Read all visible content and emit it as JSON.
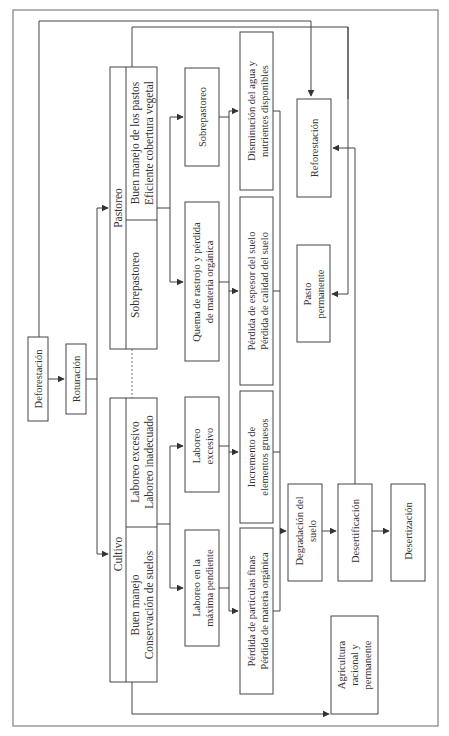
{
  "diagram": {
    "orientation": "rotated-90-ccw",
    "colors": {
      "line": "#444444",
      "frame": "#8a8a8a",
      "text": "#333333",
      "background": "#ffffff"
    },
    "nodes": {
      "deforestacion": {
        "label": "Deforestación"
      },
      "roturacion": {
        "label": "Roturación"
      },
      "pastoreo": {
        "title": "Pastoreo",
        "good": [
          "Buen manejo de los pastos",
          "Eficiente cobertura vegetal"
        ],
        "bad": [
          "Sobrepastoreo"
        ]
      },
      "cultivo": {
        "title": "Cultivo",
        "good": [
          "Buen manejo",
          "Conservación de suelos"
        ],
        "bad": [
          "Laboreo excesivo",
          "Laboreo inadecuado"
        ]
      },
      "sobrepastoreo": {
        "lines": [
          "Sobrepastoreo"
        ]
      },
      "quema": {
        "lines": [
          "Quema de rastrojo y pérdida",
          "de materia orgánica"
        ]
      },
      "laboreo_excesivo": {
        "lines": [
          "Laboreo",
          "excesivo"
        ]
      },
      "laboreo_pendiente": {
        "lines": [
          "Laboreo en la",
          "máxima pendiente"
        ]
      },
      "disminucion": {
        "lines": [
          "Disminución del agua y",
          "nutrientes disponibles"
        ]
      },
      "perdida_espesor": {
        "lines": [
          "Pérdida de espesor del suelo",
          "Pérdida de calidad del suelo"
        ]
      },
      "incremento": {
        "lines": [
          "Incremento de",
          "elementos gruesos"
        ]
      },
      "perdida_particulas": {
        "lines": [
          "Pérdida de partículas finas",
          "Pérdida de materia orgánica"
        ]
      },
      "degradacion": {
        "lines": [
          "Degradación del",
          "suelo"
        ]
      },
      "desertificacion": {
        "lines": [
          "Desertificación"
        ]
      },
      "desertizacion": {
        "lines": [
          "Desertización"
        ]
      },
      "reforestacion": {
        "lines": [
          "Reforestación"
        ]
      },
      "pasto_permanente": {
        "lines": [
          "Pasto",
          "permanente"
        ]
      },
      "agricultura": {
        "lines": [
          "Agricultura",
          "racional y",
          "permanente"
        ]
      }
    }
  }
}
